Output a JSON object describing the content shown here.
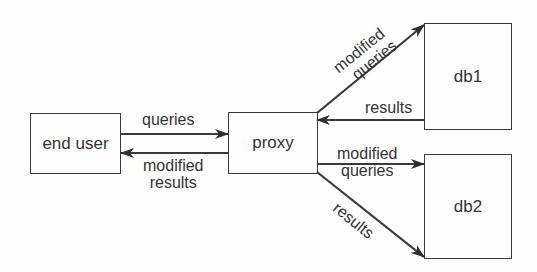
{
  "diagram": {
    "nodes": [
      {
        "id": "end_user",
        "label": "end user"
      },
      {
        "id": "proxy",
        "label": "proxy"
      },
      {
        "id": "db1",
        "label": "db1"
      },
      {
        "id": "db2",
        "label": "db2"
      }
    ],
    "edges": [
      {
        "from": "end_user",
        "to": "proxy",
        "label": "queries"
      },
      {
        "from": "proxy",
        "to": "end_user",
        "label_line1": "modified",
        "label_line2": "results"
      },
      {
        "from": "proxy",
        "to": "db1",
        "label_line1": "modified",
        "label_line2": "queries"
      },
      {
        "from": "db1",
        "to": "proxy",
        "label": "results"
      },
      {
        "from": "proxy",
        "to": "db2",
        "label_line1": "modified",
        "label_line2": "queries"
      },
      {
        "from": "proxy",
        "to": "db2",
        "label": "results"
      }
    ],
    "colors": {
      "stroke": "#3a3a3a",
      "text": "#333333",
      "background": "#fefefe"
    }
  }
}
